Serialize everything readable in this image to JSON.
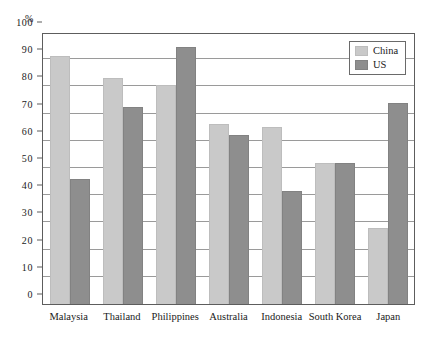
{
  "chart_data": {
    "type": "bar",
    "title": "",
    "xlabel": "",
    "ylabel": "%",
    "ylim": [
      0,
      100
    ],
    "ytick_step": 10,
    "yticks": [
      0,
      10,
      20,
      30,
      40,
      50,
      60,
      70,
      80,
      90,
      100
    ],
    "ytick_labels": [
      "0",
      "10",
      "20",
      "30",
      "40",
      "50",
      "60",
      "70",
      "80",
      "90",
      "100"
    ],
    "grid": true,
    "legend_position": "top-right",
    "categories": [
      "Malaysia",
      "Thailand",
      "Philippines",
      "Australia",
      "Indonesia",
      "South Korea",
      "Japan"
    ],
    "series": [
      {
        "name": "China",
        "color": "#c9c9c9",
        "values": [
          91,
          83,
          80.5,
          66,
          65,
          52,
          28
        ]
      },
      {
        "name": "US",
        "color": "#8e8e8e",
        "values": [
          46,
          72.5,
          94.5,
          62,
          41.5,
          52,
          74
        ]
      }
    ]
  },
  "legend": {
    "items": [
      {
        "label": "China",
        "swatch": "china"
      },
      {
        "label": "US",
        "swatch": "us"
      }
    ]
  }
}
